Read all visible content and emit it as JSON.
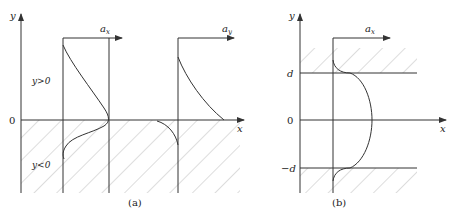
{
  "panels": {
    "a": {
      "caption": "(a)",
      "y_axis_label": "y",
      "x_axis_label": "x",
      "origin_label": "0",
      "region_upper_label": "y>0",
      "region_lower_label": "y<0",
      "profile1_label": "a",
      "profile1_sub": "x",
      "profile2_label": "a",
      "profile2_sub": "y"
    },
    "b": {
      "caption": "(b)",
      "y_axis_label": "y",
      "x_axis_label": "x",
      "origin_label": "0",
      "upper_boundary_label": "d",
      "lower_boundary_label": "−d",
      "profile_label": "a",
      "profile_sub": "x"
    }
  },
  "colors": {
    "line": "#333333",
    "hatch": "#bbbbbb",
    "background": "#ffffff"
  }
}
